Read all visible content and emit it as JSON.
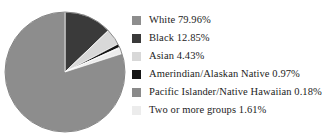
{
  "chart_data": {
    "type": "pie",
    "title": "",
    "subtitle": "",
    "xlabel": "",
    "ylabel": "",
    "grid": false,
    "legend_position": "right",
    "units": "percent",
    "start_angle_deg": 0,
    "direction": "clockwise",
    "categories": [
      "White",
      "Black",
      "Asian",
      "Amerindian/Alaskan Native",
      "Pacific Islander/Native Hawaiian",
      "Two or more groups"
    ],
    "values": [
      79.96,
      12.85,
      4.43,
      0.97,
      0.18,
      1.61
    ],
    "value_labels": [
      "79.96%",
      "12.85%",
      "4.43%",
      "0.97%",
      "0.18%",
      "1.61%"
    ],
    "colors": [
      "#8d8d8d",
      "#3a3a3a",
      "#d8d8d8",
      "#151515",
      "#8a8a8a",
      "#ececec"
    ],
    "slice_order_clockwise_from_top": [
      "Black",
      "Asian",
      "Amerindian/Alaskan Native",
      "Pacific Islander/Native Hawaiian",
      "Two or more groups",
      "White"
    ]
  },
  "legend": {
    "items": [
      {
        "label": "White 79.96%",
        "name": "White",
        "value": "79.96%",
        "color": "#8d8d8d",
        "swatch": "legend-swatch-white"
      },
      {
        "label": "Black 12.85%",
        "name": "Black",
        "value": "12.85%",
        "color": "#3a3a3a",
        "swatch": "legend-swatch-black"
      },
      {
        "label": "Asian 4.43%",
        "name": "Asian",
        "value": "4.43%",
        "color": "#d8d8d8",
        "swatch": "legend-swatch-asian"
      },
      {
        "label": "Amerindian/Alaskan Native 0.97%",
        "name": "Amerindian/Alaskan Native",
        "value": "0.97%",
        "color": "#151515",
        "swatch": "legend-swatch-amerindian"
      },
      {
        "label": "Pacific Islander/Native Hawaiian 0.18%",
        "name": "Pacific Islander/Native Hawaiian",
        "value": "0.18%",
        "color": "#8a8a8a",
        "swatch": "legend-swatch-pacific-islander"
      },
      {
        "label": "Two or more groups 1.61%",
        "name": "Two or more groups",
        "value": "1.61%",
        "color": "#ececec",
        "swatch": "legend-swatch-two-or-more"
      }
    ]
  },
  "pie": {
    "center_x": 65,
    "center_y": 72,
    "radius": 60,
    "outline_color": "#6f6f6f"
  }
}
